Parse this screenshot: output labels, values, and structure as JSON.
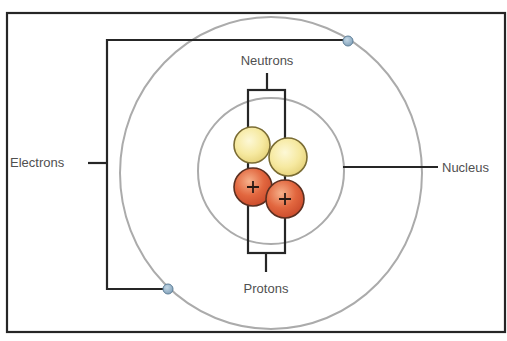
{
  "diagram": {
    "type": "atom-structure",
    "labels": {
      "neutrons": "Neutrons",
      "protons": "Protons",
      "electrons": "Electrons",
      "nucleus": "Nucleus"
    },
    "particles": {
      "neutron_count": 2,
      "proton_count": 2,
      "electron_count": 2,
      "proton_symbol": "+"
    },
    "colors": {
      "frame": "#262626",
      "orbit": "#ababab",
      "neutron_fill": "#f6e9a0",
      "neutron_stroke": "#7a6c33",
      "proton_fill": "#e2673f",
      "proton_stroke": "#5c2f20",
      "electron_fill": "#93b3cc",
      "electron_stroke": "#5f7f98",
      "label_text": "#505050"
    }
  }
}
